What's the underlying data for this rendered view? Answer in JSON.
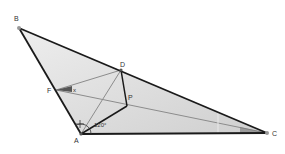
{
  "diagram": {
    "type": "geometry",
    "colors": {
      "fill": "#d9d9d9",
      "edge": "#1a1a1a",
      "construction": "#8c8c8c",
      "wedge": "#555555",
      "point": "#999999"
    },
    "points": {
      "B": {
        "label": "B",
        "x": 19,
        "y": 28
      },
      "D": {
        "label": "D",
        "x": 121,
        "y": 70
      },
      "F": {
        "label": "F",
        "x": 56,
        "y": 90
      },
      "P": {
        "label": "P",
        "x": 127,
        "y": 106
      },
      "A": {
        "label": "A",
        "x": 81,
        "y": 134
      },
      "C": {
        "label": "C",
        "x": 267,
        "y": 133
      }
    },
    "angle_label": "120°",
    "x_label": "x"
  }
}
